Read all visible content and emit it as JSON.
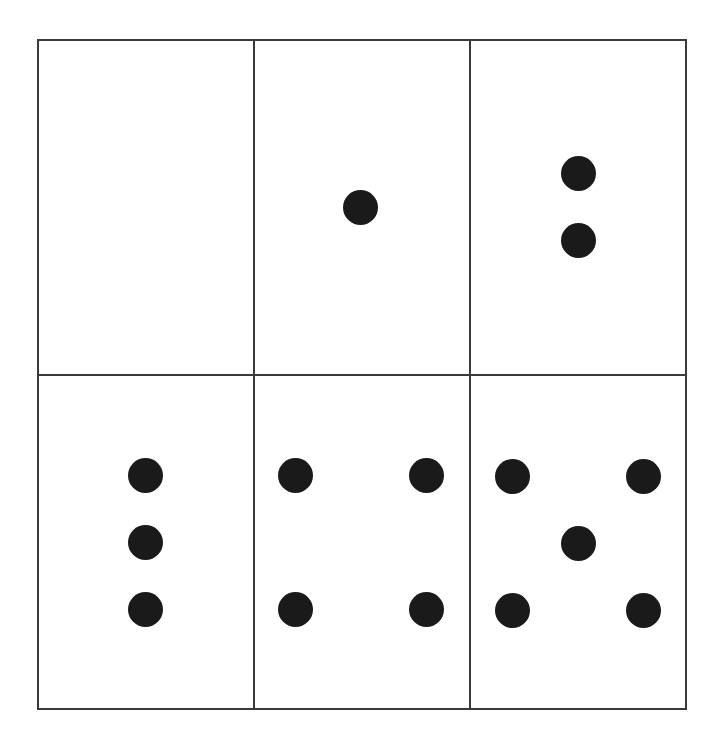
{
  "diagram": {
    "type": "dot-count-grid",
    "rows": 2,
    "cols": 3,
    "colors": {
      "line": "#3a3a3a",
      "dot": "#1a1a1a",
      "background": "#ffffff"
    },
    "cells": [
      {
        "index": 0,
        "count": 0,
        "dots": []
      },
      {
        "index": 1,
        "count": 1,
        "dots": [
          [
            360,
            207
          ]
        ]
      },
      {
        "index": 2,
        "count": 2,
        "dots": [
          [
            578,
            173
          ],
          [
            578,
            240
          ]
        ]
      },
      {
        "index": 3,
        "count": 3,
        "dots": [
          [
            145,
            475
          ],
          [
            145,
            542
          ],
          [
            145,
            609
          ]
        ]
      },
      {
        "index": 4,
        "count": 4,
        "dots": [
          [
            295,
            475
          ],
          [
            426,
            475
          ],
          [
            295,
            609
          ],
          [
            426,
            609
          ]
        ]
      },
      {
        "index": 5,
        "count": 5,
        "dots": [
          [
            512,
            476
          ],
          [
            643,
            476
          ],
          [
            578,
            543
          ],
          [
            512,
            610
          ],
          [
            643,
            610
          ]
        ]
      }
    ]
  }
}
